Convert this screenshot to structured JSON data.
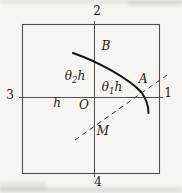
{
  "figure": {
    "description_colors": {
      "background": "#f6f5f1",
      "grid_line": "#4f4f4f",
      "curve": "#161616",
      "dashed_line": "#333333",
      "text": "#1c1c1c"
    },
    "grid_labels": {
      "top": "2",
      "bottom": "4",
      "left": "3",
      "right": "1"
    },
    "point_labels": {
      "origin": "O",
      "curve_upper": "B",
      "curve_lower": "A",
      "dashed_point": "M"
    },
    "segment_labels": {
      "h": "h",
      "theta2": {
        "sym": "θ",
        "sub": "2",
        "suffix": "h"
      },
      "theta1": {
        "sym": "θ",
        "sub": "1",
        "suffix": "h"
      }
    }
  }
}
